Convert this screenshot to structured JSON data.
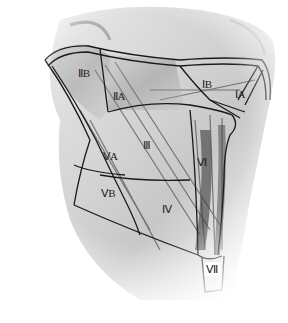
{
  "diagram": {
    "levels": [
      {
        "id": "IIB",
        "label": "ⅡB",
        "x": 84,
        "y": 73
      },
      {
        "id": "IIA",
        "label": "ⅡA",
        "x": 119,
        "y": 96
      },
      {
        "id": "IB",
        "label": "ⅠB",
        "x": 207,
        "y": 84
      },
      {
        "id": "IA",
        "label": "ⅠA",
        "x": 240,
        "y": 94
      },
      {
        "id": "III",
        "label": "Ⅲ",
        "x": 147,
        "y": 145
      },
      {
        "id": "VA",
        "label": "ⅤA",
        "x": 110,
        "y": 156
      },
      {
        "id": "VB",
        "label": "ⅤB",
        "x": 108,
        "y": 193
      },
      {
        "id": "VI",
        "label": "Ⅵ",
        "x": 202,
        "y": 162
      },
      {
        "id": "IV",
        "label": "Ⅳ",
        "x": 167,
        "y": 209
      },
      {
        "id": "VII",
        "label": "Ⅶ",
        "x": 212,
        "y": 269
      }
    ],
    "colors": {
      "boundary": "#1a1a1a",
      "muscle_dark": "#6b6b6b",
      "muscle_light": "#c8c8c8",
      "background": "#ffffff"
    }
  }
}
